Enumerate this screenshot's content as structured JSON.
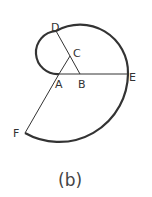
{
  "figure": {
    "caption": "(b)",
    "labels": {
      "A": "A",
      "B": "B",
      "C": "C",
      "D": "D",
      "E": "E",
      "F": "F"
    },
    "colors": {
      "stroke": "#333333",
      "background": "#ffffff"
    }
  }
}
